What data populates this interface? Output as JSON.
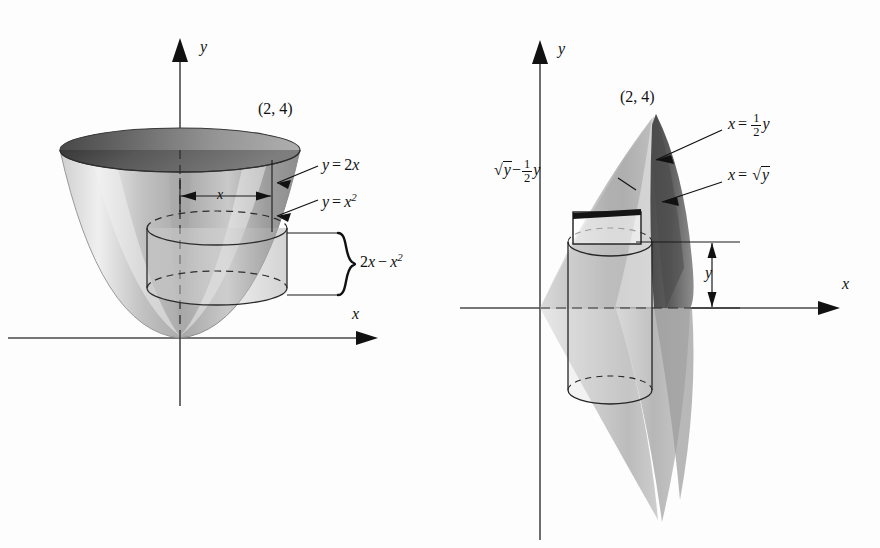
{
  "page": {
    "background": "#fdfdfd",
    "ink": "#111111"
  },
  "figures": [
    {
      "id": "left",
      "name": "shell-method-paraboloid",
      "axes": {
        "x_label": "x",
        "y_label": "y"
      },
      "point_label": "(2, 4)",
      "curve_labels": [
        {
          "text_plain": "y = 2x",
          "lhs": "y",
          "rel": "=",
          "rhs_coef": "2",
          "rhs_var": "x"
        },
        {
          "text_plain": "y = x2",
          "lhs": "y",
          "rel": "=",
          "rhs_var": "x",
          "rhs_exp": "2"
        }
      ],
      "width_marker": "x",
      "height_marker_plain": "2x - x2",
      "height_marker": {
        "a_coef": "2",
        "a_var": "x",
        "minus": "−",
        "b_var": "x",
        "b_exp": "2"
      }
    },
    {
      "id": "right",
      "name": "washer-method-solid",
      "axes": {
        "x_label": "x",
        "y_label": "y"
      },
      "point_label": "(2, 4)",
      "curve_labels": [
        {
          "text_plain": "x = 1/2 y",
          "lhs": "x",
          "rel": "=",
          "num": "1",
          "den": "2",
          "var": "y"
        },
        {
          "text_plain": "x = sqrt(y)",
          "lhs": "x",
          "rel": "=",
          "radical_arg": "y"
        }
      ],
      "thickness_label": {
        "text_plain": "sqrt(y) - 1/2 y",
        "radical_arg": "y",
        "minus": "−",
        "num": "1",
        "den": "2",
        "var": "y"
      },
      "height_marker": "y"
    }
  ],
  "colors": {
    "ink": "#111111",
    "axis": "#3a3a3a",
    "shade_light": "#d8d8d8",
    "shade_mid": "#b6b6b6",
    "shade_dark": "#8a8a8a",
    "shade_darker": "#5e5e5e"
  }
}
